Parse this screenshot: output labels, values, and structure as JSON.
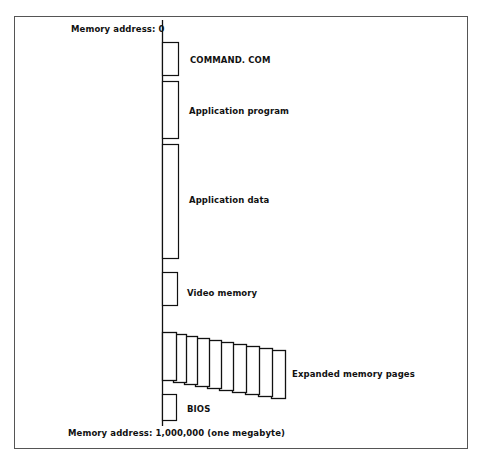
{
  "diagram": {
    "top_address_label": "Memory address:  0",
    "bottom_address_label": "Memory address:  1,000,000 (one megabyte)",
    "segments": [
      {
        "name": "command-com",
        "label": "COMMAND. COM"
      },
      {
        "name": "application-program",
        "label": "Application program"
      },
      {
        "name": "application-data",
        "label": "Application data"
      },
      {
        "name": "video-memory",
        "label": "Video memory"
      },
      {
        "name": "expanded-memory-pages",
        "label": "Expanded memory pages",
        "page_count": 10
      },
      {
        "name": "bios",
        "label": "BIOS"
      }
    ]
  }
}
